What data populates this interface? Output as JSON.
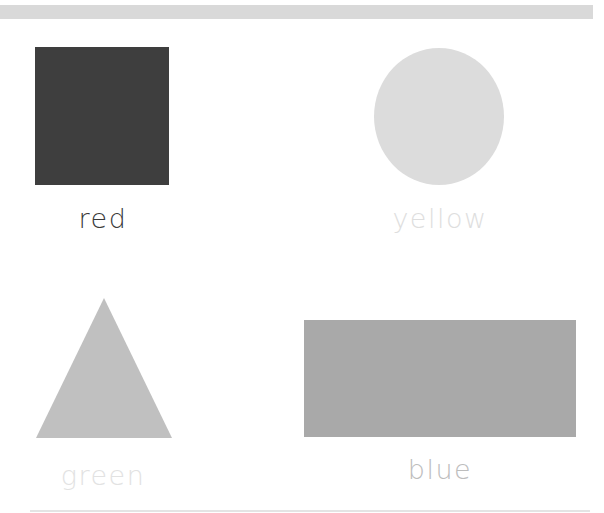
{
  "shapes": [
    {
      "shape": "square",
      "label": "red",
      "fill": "#3e3e3e",
      "label_color": "#3a3a3a"
    },
    {
      "shape": "circle",
      "label": "yellow",
      "fill": "#dcdcdc",
      "label_color": "#dedede"
    },
    {
      "shape": "triangle",
      "label": "green",
      "fill": "#c0c0c0",
      "label_color": "#e2e2e2"
    },
    {
      "shape": "rectangle",
      "label": "blue",
      "fill": "#a9a9a9",
      "label_color": "#bdbdbd"
    }
  ]
}
